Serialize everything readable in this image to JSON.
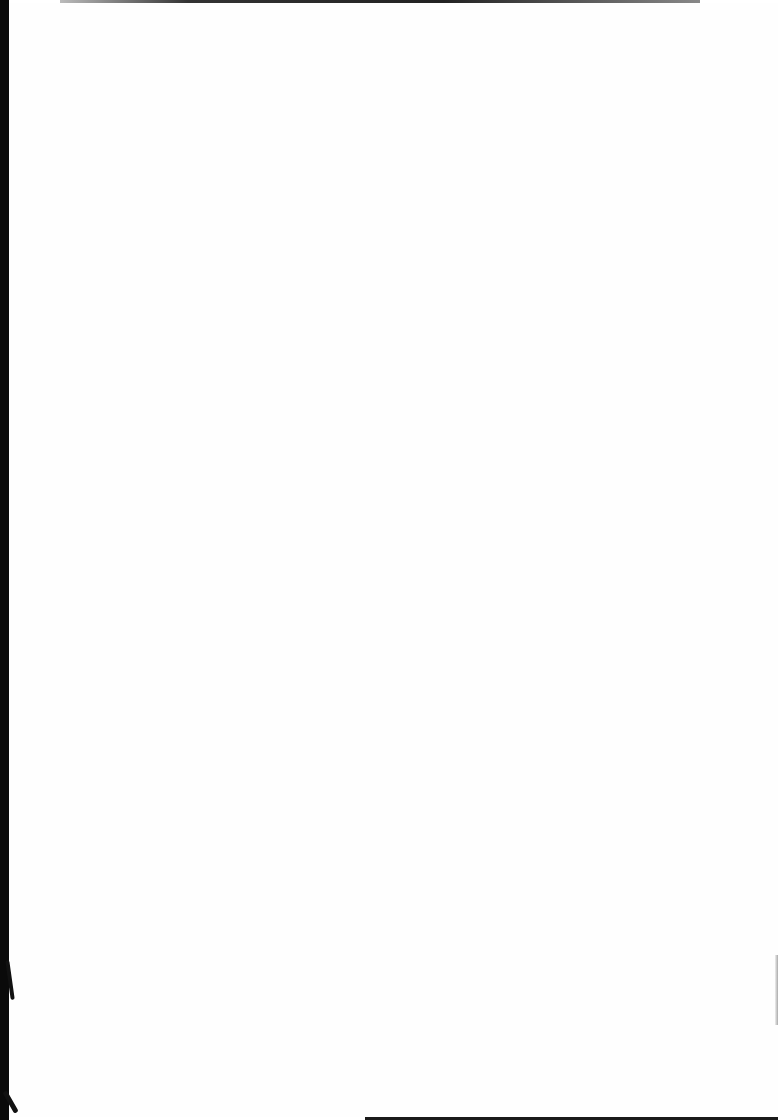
{
  "document": {
    "type": "scanned-page",
    "content": "",
    "colors": {
      "paper": "#fefefe",
      "scan_border": "#0a0a0a"
    }
  }
}
